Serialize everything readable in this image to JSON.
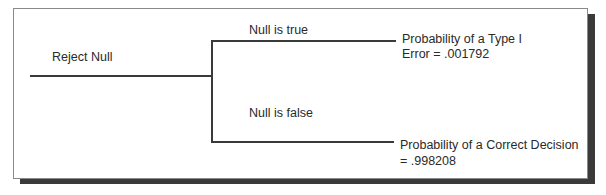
{
  "diagram": {
    "root": {
      "label": "Reject Null"
    },
    "branches": [
      {
        "label": "Null is true",
        "outcome_line1": "Probability of a Type I",
        "outcome_line2": "Error = .001792"
      },
      {
        "label": "Null is false",
        "outcome_line1": "Probability of a Correct Decision",
        "outcome_line2": "= .998208"
      }
    ]
  }
}
